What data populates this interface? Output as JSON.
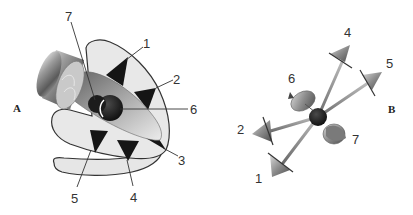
{
  "figure": {
    "panels": [
      {
        "id": "A",
        "label": "A",
        "callouts": [
          {
            "n": "1",
            "label": "1"
          },
          {
            "n": "2",
            "label": "2"
          },
          {
            "n": "3",
            "label": "3"
          },
          {
            "n": "4",
            "label": "4"
          },
          {
            "n": "5",
            "label": "5"
          },
          {
            "n": "6",
            "label": "6"
          },
          {
            "n": "7",
            "label": "7"
          }
        ]
      },
      {
        "id": "B",
        "label": "B",
        "callouts": [
          {
            "n": "1",
            "label": "1"
          },
          {
            "n": "2",
            "label": "2"
          },
          {
            "n": "4",
            "label": "4"
          },
          {
            "n": "5",
            "label": "5"
          },
          {
            "n": "6",
            "label": "6"
          },
          {
            "n": "7",
            "label": "7"
          }
        ]
      }
    ],
    "colors": {
      "outline": "#333333",
      "fill_light": "#e6e6e6",
      "triangle": "#151515",
      "ball": "#1a1a1a",
      "metal": "#8a8a8a"
    }
  }
}
